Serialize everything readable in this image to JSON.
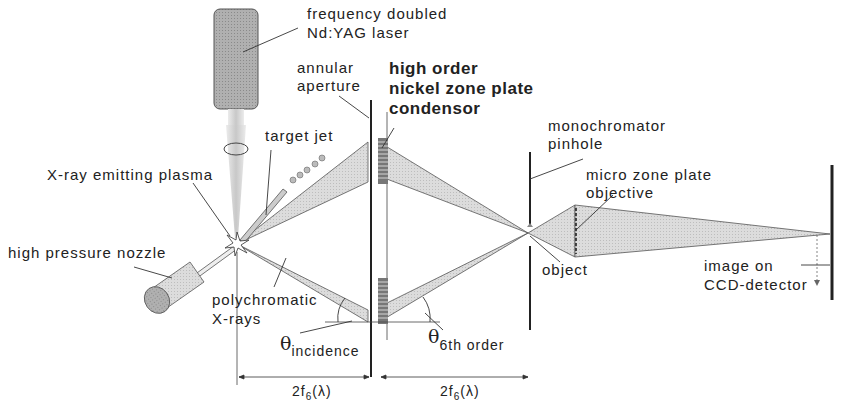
{
  "diagram": {
    "type": "optical-setup",
    "labels": {
      "laser": [
        "frequency doubled",
        "Nd:YAG laser"
      ],
      "annular_aperture": [
        "annular",
        "aperture"
      ],
      "condensor": [
        "high order",
        "nickel zone plate",
        "condensor"
      ],
      "target_jet": "target jet",
      "plasma": "X-ray emitting plasma",
      "nozzle": "high pressure nozzle",
      "polychromatic": [
        "polychromatic",
        "X-rays"
      ],
      "theta_incidence": {
        "symbol": "θ",
        "subscript": "incidence"
      },
      "theta_order": {
        "symbol": "θ",
        "subscript": "6th order"
      },
      "monochromator": [
        "monochromator",
        "pinhole"
      ],
      "micro_zone_plate": [
        "micro zone plate",
        "objective"
      ],
      "object": "object",
      "image": [
        "image on",
        "CCD-detector"
      ],
      "distance_left": {
        "prefix": "2f",
        "sub": "6",
        "suffix": "(λ)"
      },
      "distance_right": {
        "prefix": "2f",
        "sub": "6",
        "suffix": "(λ)"
      }
    },
    "colors": {
      "beam_fill": "#d6d6d6",
      "component_fill": "#a8a8a8",
      "line": "#222222"
    }
  }
}
